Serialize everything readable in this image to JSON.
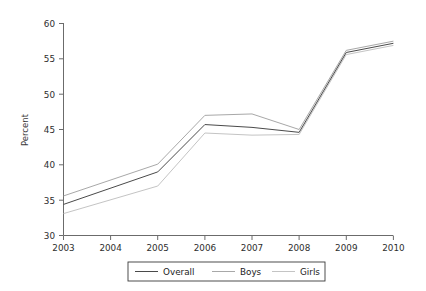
{
  "chart_data": {
    "type": "line",
    "title": "",
    "subtitle": "",
    "xlabel": "",
    "ylabel": "Percent",
    "categories": [
      "2003",
      "2004",
      "2005",
      "2006",
      "2007",
      "2008",
      "2009",
      "2010"
    ],
    "x": [
      2003,
      2005,
      2006,
      2007,
      2008,
      2009,
      2010
    ],
    "xlim": [
      2003,
      2010
    ],
    "ylim": [
      30,
      60
    ],
    "yticks": [
      30,
      35,
      40,
      45,
      50,
      55,
      60
    ],
    "ytick_labels": [
      "30",
      "35",
      "40",
      "45",
      "50",
      "55",
      "60"
    ],
    "xticks": [
      2003,
      2004,
      2005,
      2006,
      2007,
      2008,
      2009,
      2010
    ],
    "xtick_labels": [
      "2003",
      "2004",
      "2005",
      "2006",
      "2007",
      "2008",
      "2009",
      "2010"
    ],
    "grid": false,
    "legend_position": "bottom",
    "series": [
      {
        "name": "Overall",
        "color": "#4a4a4a",
        "x": [
          2003,
          2005,
          2006,
          2007,
          2008,
          2009,
          2010
        ],
        "values": [
          34.4,
          39.0,
          45.7,
          45.3,
          44.6,
          55.9,
          57.2
        ]
      },
      {
        "name": "Boys",
        "color": "#a8a8a8",
        "x": [
          2003,
          2005,
          2006,
          2007,
          2008,
          2009,
          2010
        ],
        "values": [
          35.6,
          40.1,
          47.0,
          47.2,
          45.0,
          56.2,
          57.5
        ]
      },
      {
        "name": "Girls",
        "color": "#c4c4c4",
        "x": [
          2003,
          2005,
          2006,
          2007,
          2008,
          2009,
          2010
        ],
        "values": [
          33.1,
          37.0,
          44.5,
          44.2,
          44.3,
          55.6,
          56.9
        ]
      }
    ]
  },
  "axes": {
    "y_axis_title": "Percent",
    "y_tick_labels": [
      "60",
      "55",
      "50",
      "45",
      "40",
      "35",
      "30"
    ],
    "x_tick_labels": [
      "2003",
      "2004",
      "2005",
      "2006",
      "2007",
      "2008",
      "2009",
      "2010"
    ]
  },
  "legend": {
    "items": [
      {
        "label": "Overall",
        "color": "#4a4a4a"
      },
      {
        "label": "Boys",
        "color": "#a8a8a8"
      },
      {
        "label": "Girls",
        "color": "#c4c4c4"
      }
    ]
  },
  "colors": {
    "axis": "#6b6b6b",
    "text": "#2e2e2e",
    "background": "#ffffff",
    "overall": "#4a4a4a",
    "boys": "#a8a8a8",
    "girls": "#c4c4c4",
    "legend_border": "#3a3a3a"
  }
}
